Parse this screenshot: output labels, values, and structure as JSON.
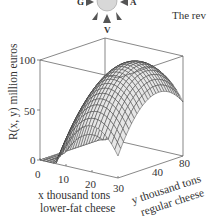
{
  "header": {
    "compass_letters": {
      "left": "G",
      "right": "A",
      "bottom": "V"
    },
    "text_snippet": "The rev"
  },
  "chart_data": {
    "type": "surface3d",
    "title": "",
    "function_label": "R(x, y) million euros",
    "xlabel_line1": "x thousand tons",
    "xlabel_line2": "lower-fat cheese",
    "ylabel_line1": "y thousand tons",
    "ylabel_line2": "regular cheese",
    "zlabel": "R(x, y) million euros",
    "x_ticks": [
      0,
      10,
      20,
      30
    ],
    "y_ticks": [
      40,
      80
    ],
    "z_ticks": [
      0,
      50,
      100
    ],
    "xlim": [
      0,
      30
    ],
    "ylim": [
      0,
      80
    ],
    "zlim": [
      0,
      100
    ],
    "surface": {
      "form": "R = max(0, peak - a*(x-x0)^2 - b*(y-y0)^2)",
      "peak": 96,
      "x0": 20,
      "y0": 50,
      "a": 0.24,
      "b": 0.02,
      "grid_x": 24,
      "grid_y": 24
    },
    "grid": false,
    "legend": null
  }
}
